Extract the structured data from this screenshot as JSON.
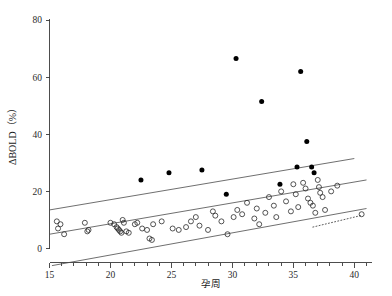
{
  "chart_data": {
    "type": "scatter",
    "title": "",
    "xlabel": "孕周",
    "ylabel": "ΔBOLD（%）",
    "xlim": [
      15,
      41
    ],
    "ylim": [
      -10,
      85
    ],
    "grid": false,
    "legend": "none",
    "x_ticks_major": [
      15,
      20,
      25,
      30,
      35,
      40
    ],
    "x_ticks_minor": [
      16,
      17,
      18,
      19,
      21,
      22,
      23,
      24,
      26,
      27,
      28,
      29,
      31,
      32,
      33,
      34,
      36,
      37,
      38,
      39,
      41
    ],
    "y_ticks_major": [
      0,
      20,
      40,
      60,
      80
    ],
    "series": [
      {
        "name": "open-circles",
        "marker": "open-circle",
        "x": [
          15.6,
          15.7,
          15.9,
          16.2,
          17.9,
          18.1,
          18.2,
          20.0,
          20.3,
          20.5,
          20.6,
          20.7,
          20.8,
          20.9,
          21.0,
          21.1,
          21.3,
          21.5,
          22.0,
          22.2,
          22.6,
          23.0,
          23.2,
          23.4,
          23.5,
          24.2,
          25.1,
          25.6,
          26.2,
          26.6,
          27.0,
          27.3,
          28.0,
          28.4,
          28.6,
          29.1,
          29.6,
          30.1,
          30.4,
          30.8,
          31.2,
          31.8,
          32.0,
          32.2,
          32.7,
          33.0,
          33.4,
          33.6,
          34.0,
          34.4,
          34.8,
          35.0,
          35.2,
          35.4,
          35.8,
          36.0,
          36.2,
          36.4,
          36.6,
          36.8,
          37.0,
          37.1,
          37.2,
          37.4,
          37.6,
          38.1,
          38.6,
          40.6
        ],
        "y": [
          9.5,
          7.0,
          8.5,
          5.0,
          9.0,
          6.0,
          6.5,
          9.0,
          8.5,
          7.5,
          7.0,
          6.5,
          6.0,
          5.5,
          10.0,
          9.0,
          6.0,
          5.5,
          8.5,
          9.0,
          7.0,
          6.5,
          3.5,
          3.0,
          8.5,
          9.5,
          7.0,
          6.5,
          7.5,
          9.5,
          11.0,
          8.0,
          6.5,
          13.0,
          11.5,
          9.5,
          5.0,
          11.0,
          13.5,
          12.0,
          16.0,
          10.5,
          14.0,
          8.5,
          12.5,
          18.0,
          15.0,
          11.0,
          20.0,
          16.5,
          13.0,
          22.5,
          19.0,
          14.5,
          23.0,
          21.0,
          17.5,
          16.0,
          15.0,
          12.5,
          24.0,
          21.5,
          19.5,
          18.0,
          13.5,
          20.0,
          22.0,
          12.0
        ]
      },
      {
        "name": "filled-dots",
        "marker": "filled-dot",
        "x": [
          22.5,
          24.8,
          27.5,
          29.5,
          30.3,
          32.4,
          33.9,
          35.3,
          35.6,
          36.1,
          36.5,
          36.7
        ],
        "y": [
          24.0,
          26.5,
          27.5,
          19.0,
          66.5,
          51.5,
          22.5,
          28.5,
          62.0,
          37.5,
          28.5,
          26.5
        ]
      }
    ],
    "fit_lines": [
      {
        "name": "upper-bound",
        "x0": 15.0,
        "y0": 13.5,
        "x1": 40.0,
        "y1": 31.5,
        "style": "solid"
      },
      {
        "name": "mean-fit",
        "x0": 15.0,
        "y0": 5.0,
        "x1": 41.0,
        "y1": 24.0,
        "style": "solid"
      },
      {
        "name": "lower-bound",
        "x0": 15.2,
        "y0": -6.0,
        "x1": 41.0,
        "y1": 14.0,
        "style": "solid"
      },
      {
        "name": "extrapolation-dotted",
        "x0": 36.6,
        "y0": 7.5,
        "x1": 40.5,
        "y1": 11.5,
        "style": "dotted"
      }
    ]
  }
}
